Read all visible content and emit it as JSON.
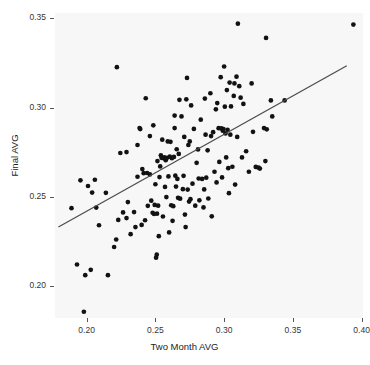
{
  "chart_data": {
    "type": "scatter",
    "title": "",
    "xlabel": "Two Month AVG",
    "ylabel": "Final AVG",
    "xlim": [
      0.177,
      0.401
    ],
    "ylim": [
      0.182,
      0.353
    ],
    "xticks": [
      0.2,
      0.25,
      0.3,
      0.35,
      0.4
    ],
    "xticklabels": [
      "0.20",
      "0.25",
      "0.30",
      "0.35",
      "0.40"
    ],
    "yticks": [
      0.2,
      0.25,
      0.3,
      0.35
    ],
    "yticklabels": [
      "0.20",
      "0.25",
      "0.30",
      "0.35"
    ],
    "grid": false,
    "legend": "none",
    "panel_background": "#f7f7f7",
    "point_color": "#121212",
    "line_color": "#4d4d4d",
    "series": [
      {
        "name": "players",
        "marker": "filled-circle",
        "points": [
          [
            0.1955,
            0.2592
          ],
          [
            0.199,
            0.206
          ],
          [
            0.193,
            0.212
          ],
          [
            0.203,
            0.209
          ],
          [
            0.201,
            0.256
          ],
          [
            0.204,
            0.2523
          ],
          [
            0.206,
            0.2595
          ],
          [
            0.207,
            0.2439
          ],
          [
            0.189,
            0.2436
          ],
          [
            0.214,
            0.2522
          ],
          [
            0.2155,
            0.206
          ],
          [
            0.22,
            0.2218
          ],
          [
            0.2215,
            0.226
          ],
          [
            0.222,
            0.3226
          ],
          [
            0.2245,
            0.2745
          ],
          [
            0.223,
            0.237
          ],
          [
            0.2265,
            0.2412
          ],
          [
            0.229,
            0.238
          ],
          [
            0.23,
            0.247
          ],
          [
            0.232,
            0.229
          ],
          [
            0.2345,
            0.2414
          ],
          [
            0.2355,
            0.233
          ],
          [
            0.237,
            0.2612
          ],
          [
            0.2385,
            0.2885
          ],
          [
            0.239,
            0.2879
          ],
          [
            0.24,
            0.2342
          ],
          [
            0.2405,
            0.2655
          ],
          [
            0.2415,
            0.2632
          ],
          [
            0.2425,
            0.2368
          ],
          [
            0.243,
            0.3052
          ],
          [
            0.244,
            0.2633
          ],
          [
            0.2445,
            0.2449
          ],
          [
            0.246,
            0.284
          ],
          [
            0.247,
            0.2478
          ],
          [
            0.248,
            0.241
          ],
          [
            0.2485,
            0.29
          ],
          [
            0.249,
            0.2403
          ],
          [
            0.2495,
            0.2454
          ],
          [
            0.25,
            0.257
          ],
          [
            0.2505,
            0.2158
          ],
          [
            0.251,
            0.2175
          ],
          [
            0.2512,
            0.2405
          ],
          [
            0.2515,
            0.27
          ],
          [
            0.252,
            0.245
          ],
          [
            0.2525,
            0.2279
          ],
          [
            0.253,
            0.261
          ],
          [
            0.2535,
            0.267
          ],
          [
            0.254,
            0.2732
          ],
          [
            0.2545,
            0.2718
          ],
          [
            0.255,
            0.282
          ],
          [
            0.2555,
            0.2389
          ],
          [
            0.256,
            0.2716
          ],
          [
            0.2565,
            0.2721
          ],
          [
            0.257,
            0.2555
          ],
          [
            0.2575,
            0.2705
          ],
          [
            0.258,
            0.2498
          ],
          [
            0.2585,
            0.2718
          ],
          [
            0.259,
            0.281
          ],
          [
            0.2595,
            0.2614
          ],
          [
            0.26,
            0.23
          ],
          [
            0.2605,
            0.2725
          ],
          [
            0.261,
            0.2808
          ],
          [
            0.2615,
            0.2452
          ],
          [
            0.262,
            0.2716
          ],
          [
            0.2625,
            0.2365
          ],
          [
            0.263,
            0.2447
          ],
          [
            0.2635,
            0.2723
          ],
          [
            0.264,
            0.2955
          ],
          [
            0.2645,
            0.2618
          ],
          [
            0.265,
            0.2557
          ],
          [
            0.2655,
            0.2766
          ],
          [
            0.266,
            0.26
          ],
          [
            0.2665,
            0.2494
          ],
          [
            0.267,
            0.274
          ],
          [
            0.2675,
            0.3043
          ],
          [
            0.268,
            0.2489
          ],
          [
            0.269,
            0.295
          ],
          [
            0.27,
            0.2542
          ],
          [
            0.2705,
            0.2617
          ],
          [
            0.271,
            0.2835
          ],
          [
            0.2715,
            0.24
          ],
          [
            0.272,
            0.233
          ],
          [
            0.2725,
            0.3046
          ],
          [
            0.273,
            0.3166
          ],
          [
            0.2735,
            0.254
          ],
          [
            0.274,
            0.279
          ],
          [
            0.2745,
            0.2473
          ],
          [
            0.275,
            0.281
          ],
          [
            0.2755,
            0.2486
          ],
          [
            0.276,
            0.3012
          ],
          [
            0.277,
            0.2573
          ],
          [
            0.278,
            0.288
          ],
          [
            0.279,
            0.245
          ],
          [
            0.28,
            0.269
          ],
          [
            0.281,
            0.2765
          ],
          [
            0.2815,
            0.2602
          ],
          [
            0.282,
            0.248
          ],
          [
            0.283,
            0.2932
          ],
          [
            0.284,
            0.26
          ],
          [
            0.285,
            0.244
          ],
          [
            0.2855,
            0.2541
          ],
          [
            0.286,
            0.305
          ],
          [
            0.2865,
            0.2848
          ],
          [
            0.287,
            0.2607
          ],
          [
            0.288,
            0.276
          ],
          [
            0.2885,
            0.249
          ],
          [
            0.29,
            0.308
          ],
          [
            0.2905,
            0.284
          ],
          [
            0.291,
            0.239
          ],
          [
            0.292,
            0.2862
          ],
          [
            0.293,
            0.264
          ],
          [
            0.294,
            0.299
          ],
          [
            0.2945,
            0.258
          ],
          [
            0.295,
            0.3025
          ],
          [
            0.296,
            0.2884
          ],
          [
            0.2965,
            0.2695
          ],
          [
            0.2975,
            0.317
          ],
          [
            0.298,
            0.2883
          ],
          [
            0.2985,
            0.2608
          ],
          [
            0.299,
            0.287
          ],
          [
            0.2995,
            0.2879
          ],
          [
            0.3,
            0.323
          ],
          [
            0.3005,
            0.3005
          ],
          [
            0.301,
            0.2855
          ],
          [
            0.3015,
            0.272
          ],
          [
            0.302,
            0.3098
          ],
          [
            0.3025,
            0.2875
          ],
          [
            0.303,
            0.266
          ],
          [
            0.3035,
            0.252
          ],
          [
            0.304,
            0.314
          ],
          [
            0.3045,
            0.2848
          ],
          [
            0.305,
            0.3006
          ],
          [
            0.306,
            0.2668
          ],
          [
            0.307,
            0.3065
          ],
          [
            0.3075,
            0.3135
          ],
          [
            0.308,
            0.2568
          ],
          [
            0.309,
            0.3173
          ],
          [
            0.3095,
            0.2835
          ],
          [
            0.31,
            0.347
          ],
          [
            0.311,
            0.312
          ],
          [
            0.312,
            0.3055
          ],
          [
            0.313,
            0.272
          ],
          [
            0.314,
            0.302
          ],
          [
            0.316,
            0.2755
          ],
          [
            0.318,
            0.264
          ],
          [
            0.32,
            0.3135
          ],
          [
            0.321,
            0.2864
          ],
          [
            0.323,
            0.2667
          ],
          [
            0.325,
            0.2663
          ],
          [
            0.326,
            0.2658
          ],
          [
            0.329,
            0.2885
          ],
          [
            0.33,
            0.27
          ],
          [
            0.3305,
            0.339
          ],
          [
            0.331,
            0.2878
          ],
          [
            0.334,
            0.304
          ],
          [
            0.335,
            0.295
          ],
          [
            0.344,
            0.304
          ],
          [
            0.394,
            0.3465
          ],
          [
            0.198,
            0.1855
          ],
          [
            0.209,
            0.234
          ],
          [
            0.237,
            0.279
          ],
          [
            0.246,
            0.2625
          ],
          [
            0.229,
            0.275
          ],
          [
            0.264,
            0.2885
          ]
        ]
      }
    ],
    "fit_line": {
      "name": "linear fit",
      "x": [
        0.1795,
        0.3892
      ],
      "y": [
        0.233,
        0.3234
      ]
    }
  }
}
